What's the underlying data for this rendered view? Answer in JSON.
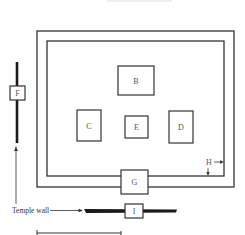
{
  "diagram": {
    "type": "temple-plan",
    "colors": {
      "line": "#333333",
      "wall": "#1a1a1a",
      "background": "#ffffff"
    },
    "enclosure": {
      "outer": {
        "x": 37,
        "y": 31,
        "w": 197,
        "h": 156
      },
      "inner": {
        "x": 47,
        "y": 41,
        "w": 177,
        "h": 135
      }
    },
    "buildings": [
      {
        "id": "B",
        "label": "B",
        "x": 118,
        "y": 66,
        "w": 36,
        "h": 29
      },
      {
        "id": "C",
        "label": "C",
        "x": 77,
        "y": 110,
        "w": 24,
        "h": 31
      },
      {
        "id": "E",
        "label": "E",
        "x": 125,
        "y": 116,
        "w": 23,
        "h": 22
      },
      {
        "id": "D",
        "label": "D",
        "x": 169,
        "y": 111,
        "w": 24,
        "h": 32
      },
      {
        "id": "G",
        "label": "G",
        "x": 121,
        "y": 170,
        "w": 27,
        "h": 24
      },
      {
        "id": "F",
        "label": "F",
        "x": 10,
        "y": 86,
        "w": 15,
        "h": 14
      },
      {
        "id": "I",
        "label": "I",
        "x": 125,
        "y": 204,
        "w": 18,
        "h": 14
      }
    ],
    "annotations": {
      "H": {
        "label": "H"
      },
      "temple_wall": {
        "label": "Temple wall"
      }
    }
  }
}
